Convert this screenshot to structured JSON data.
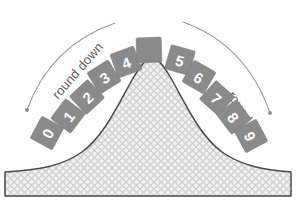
{
  "figure": {
    "name": "rounding-bell-curve-diagram",
    "background_color": "#ffffff",
    "width": 296,
    "height": 212
  },
  "labels": {
    "round_down": "round down",
    "round_up": "round up"
  },
  "colors": {
    "tile_fill": "#8a8a8a",
    "tile_digit": "#ffffff",
    "arc_stroke": "#9a9a9a",
    "label_text": "#5e5e5e",
    "curve_outline": "#4a4a4a",
    "hatch_line": "#c9c9c9",
    "hatch_base": "#efefef"
  },
  "tiles": [
    {
      "digit": "0",
      "x": 47,
      "y": 133,
      "rotate": -62,
      "blank": false
    },
    {
      "digit": "1",
      "x": 68,
      "y": 116,
      "rotate": -53,
      "blank": false
    },
    {
      "digit": "2",
      "x": 87,
      "y": 97,
      "rotate": -43,
      "blank": false
    },
    {
      "digit": "3",
      "x": 104,
      "y": 77,
      "rotate": -32,
      "blank": false
    },
    {
      "digit": "4",
      "x": 126,
      "y": 62,
      "rotate": -20,
      "blank": false
    },
    {
      "digit": "",
      "x": 149,
      "y": 50,
      "rotate": -2,
      "blank": true
    },
    {
      "digit": "5",
      "x": 180,
      "y": 60,
      "rotate": 16,
      "blank": false
    },
    {
      "digit": "6",
      "x": 199,
      "y": 77,
      "rotate": 30,
      "blank": false
    },
    {
      "digit": "7",
      "x": 217,
      "y": 98,
      "rotate": 42,
      "blank": false
    },
    {
      "digit": "8",
      "x": 234,
      "y": 117,
      "rotate": 53,
      "blank": false
    },
    {
      "digit": "9",
      "x": 251,
      "y": 136,
      "rotate": 62,
      "blank": false
    }
  ],
  "tile_size": {
    "w": 25,
    "h": 25
  },
  "arcs": {
    "left": {
      "name": "round-down-arc",
      "path": "M 27 110 C 40 74 66 40 115 23",
      "cap_x": 27,
      "cap_y": 110
    },
    "right": {
      "name": "round-up-arc",
      "path": "M 183 22 C 231 39 256 73 270 113",
      "cap_x": 270,
      "cap_y": 113
    }
  },
  "curve": {
    "name": "bell-curve",
    "path": "M 5 196 L 5 172 C 40 170 62 166 82 152 C 104 136 118 105 132 80 C 140 66 146 58 152 58 C 158 58 164 66 172 80 C 186 105 200 136 222 152 C 242 166 264 170 291 172 L 291 196 Z",
    "baseline_y": 196
  },
  "hatch_band": {
    "name": "hatched-base-band",
    "x": 5,
    "y": 172,
    "width": 286,
    "height": 30
  }
}
